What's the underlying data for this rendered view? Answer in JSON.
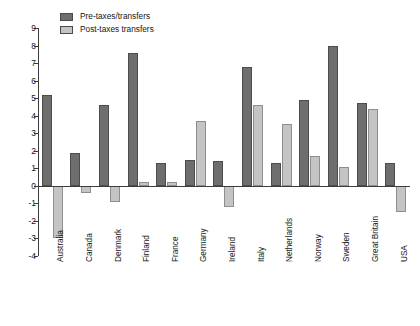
{
  "chart_data": {
    "type": "bar",
    "title": "",
    "subtitle": "",
    "xlabel": "",
    "ylabel": "",
    "ylim": [
      -4,
      9
    ],
    "ytick_step": 1,
    "yticks": [
      9,
      8,
      7,
      6,
      5,
      4,
      3,
      2,
      1,
      0,
      -1,
      -2,
      -3,
      -4
    ],
    "ytick_labels": [
      "9",
      "8",
      "7",
      "6",
      "5",
      "4",
      "3",
      "2",
      "1",
      "0",
      "-1",
      "-2",
      "-3",
      "-4"
    ],
    "grid": false,
    "legend_position": "top-left",
    "categories": [
      "Australia",
      "Canada",
      "Denmark",
      "Finland",
      "France",
      "Germany",
      "Ireland",
      "Italy",
      "Netherlands",
      "Norway",
      "Sweden",
      "Great Britain",
      "USA"
    ],
    "series": [
      {
        "name": "Pre-taxes/transfers",
        "color": "#6e6e6e",
        "values": [
          5.2,
          1.9,
          4.6,
          7.6,
          1.3,
          1.5,
          1.4,
          6.8,
          1.3,
          4.9,
          8.0,
          4.7,
          1.3
        ]
      },
      {
        "name": "Post-taxes transfers",
        "color": "#c4c4c4",
        "values": [
          -3.0,
          -0.4,
          -0.9,
          0.2,
          0.2,
          3.7,
          -1.2,
          4.6,
          3.5,
          1.7,
          1.1,
          4.4,
          -1.5
        ]
      }
    ]
  },
  "legend": {
    "entries": [
      {
        "label": "Pre-taxes/transfers",
        "swatch": "legend-swatch-pre"
      },
      {
        "label": "Post-taxes transfers",
        "swatch": "legend-swatch-post"
      }
    ]
  },
  "colors": {
    "pre_taxes": "#6e6e6e",
    "post_taxes": "#c4c4c4",
    "axis": "#3c3c3c",
    "background": "#ffffff"
  }
}
